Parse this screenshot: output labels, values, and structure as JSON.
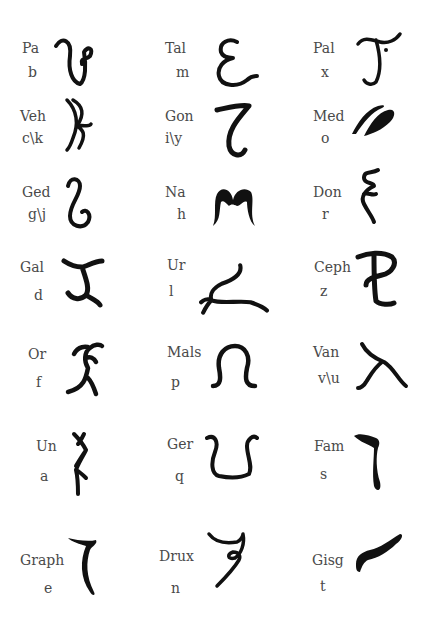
{
  "letters": [
    {
      "name": "Pa",
      "sound": "b",
      "glyph": "pa-glyph"
    },
    {
      "name": "Tal",
      "sound": "m",
      "glyph": "tal-glyph"
    },
    {
      "name": "Pal",
      "sound": "x",
      "glyph": "pal-glyph"
    },
    {
      "name": "Veh",
      "sound": "c\\k",
      "glyph": "veh-glyph"
    },
    {
      "name": "Gon",
      "sound": "i\\y",
      "glyph": "gon-glyph"
    },
    {
      "name": "Med",
      "sound": "o",
      "glyph": "med-glyph"
    },
    {
      "name": "Ged",
      "sound": "g\\j",
      "glyph": "ged-glyph"
    },
    {
      "name": "Na",
      "sound": "h",
      "glyph": "na-glyph"
    },
    {
      "name": "Don",
      "sound": "r",
      "glyph": "don-glyph"
    },
    {
      "name": "Gal",
      "sound": "d",
      "glyph": "gal-glyph"
    },
    {
      "name": "Ur",
      "sound": "l",
      "glyph": "ur-glyph"
    },
    {
      "name": "Ceph",
      "sound": "z",
      "glyph": "ceph-glyph"
    },
    {
      "name": "Or",
      "sound": "f",
      "glyph": "or-glyph"
    },
    {
      "name": "Mals",
      "sound": "p",
      "glyph": "mals-glyph"
    },
    {
      "name": "Van",
      "sound": "v\\u",
      "glyph": "van-glyph"
    },
    {
      "name": "Un",
      "sound": "a",
      "glyph": "un-glyph"
    },
    {
      "name": "Ger",
      "sound": "q",
      "glyph": "ger-glyph"
    },
    {
      "name": "Fam",
      "sound": "s",
      "glyph": "fam-glyph"
    },
    {
      "name": "Graph",
      "sound": "e",
      "glyph": "graph-glyph"
    },
    {
      "name": "Drux",
      "sound": "n",
      "glyph": "drux-glyph"
    },
    {
      "name": "Gisg",
      "sound": "t",
      "glyph": "gisg-glyph"
    }
  ],
  "colors": {
    "ink": "#111111",
    "label": "#4a4a4a",
    "background": "#ffffff"
  }
}
